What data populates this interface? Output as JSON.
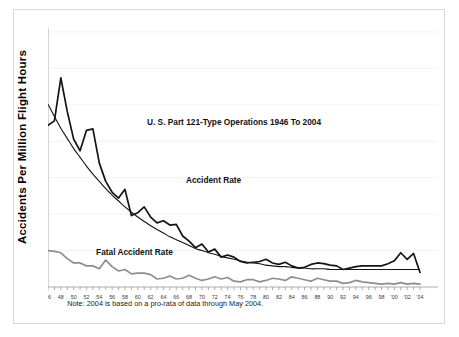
{
  "figure": {
    "note": "Note: 2004 is based on a pro-rata of data through May 2004.",
    "ylabel": "Accidents Per Million Flight Hours",
    "title": "U. S. Part 121-Type Operations 1946 To 2004",
    "label_accident": "Accident Rate",
    "label_fatal": "Fatal Accident Rate"
  },
  "colors": {
    "accident": "#141414",
    "trend": "#141414",
    "fatal": "#8e8e8e",
    "grid": "#ececec",
    "axis": "#9a9a9a",
    "border": "#d8d8d8"
  },
  "chart_data": {
    "type": "line",
    "title": "U. S. Part 121-Type Operations 1946 To 2004",
    "xlabel": "",
    "ylabel": "Accidents Per Million Flight Hours",
    "ylim": [
      0,
      35
    ],
    "xlim": [
      1946,
      2004
    ],
    "yticks": [
      0,
      5,
      10,
      15,
      20,
      25,
      30,
      35
    ],
    "ytick_labels": [
      "0",
      "5",
      "10",
      "15",
      "20",
      "25",
      "30",
      "35"
    ],
    "grid": true,
    "grid_axis": "y",
    "legend": "inline-annotations",
    "annotations": [
      {
        "text": "U. S. Part 121-Type Operations 1946 To 2004",
        "x": 1975,
        "y": 22.2
      },
      {
        "text": "Accident Rate",
        "x": 1967.5,
        "y": 14.3
      },
      {
        "text": "Fatal Accident Rate",
        "x": 1953.5,
        "y": 4.4
      },
      {
        "text": "Note: 2004 is based on a pro-rata of data through May 2004.",
        "x": 1949,
        "y": -2.6
      }
    ],
    "x": [
      1946,
      1947,
      1948,
      1949,
      1950,
      1951,
      1952,
      1953,
      1954,
      1955,
      1956,
      1957,
      1958,
      1959,
      1960,
      1961,
      1962,
      1963,
      1964,
      1965,
      1966,
      1967,
      1968,
      1969,
      1970,
      1971,
      1972,
      1973,
      1974,
      1975,
      1976,
      1977,
      1978,
      1979,
      1980,
      1981,
      1982,
      1983,
      1984,
      1985,
      1986,
      1987,
      1988,
      1989,
      1990,
      1991,
      1992,
      1993,
      1994,
      1995,
      1996,
      1997,
      1998,
      1999,
      2000,
      2001,
      2002,
      2003,
      2004
    ],
    "xtick_labels": [
      "46",
      "48",
      "50",
      "52",
      "54",
      "56",
      "58",
      "60",
      "62",
      "64",
      "66",
      "68",
      "70",
      "72",
      "74",
      "76",
      "78",
      "80",
      "82",
      "84",
      "86",
      "88",
      "90",
      "92",
      "94",
      "96",
      "98",
      "'00",
      "'02",
      "'04"
    ],
    "series": [
      {
        "name": "Accident Rate",
        "color": "#141414",
        "style": "solid",
        "width": 1.7,
        "values": [
          22.2,
          22.8,
          28.7,
          24.1,
          20.3,
          18.7,
          21.5,
          21.7,
          17.0,
          14.5,
          13.0,
          12.2,
          13.4,
          9.8,
          10.2,
          11.0,
          9.6,
          8.8,
          9.1,
          8.5,
          8.6,
          7.0,
          6.3,
          5.4,
          5.9,
          4.8,
          5.2,
          4.1,
          4.4,
          4.1,
          3.5,
          3.3,
          3.4,
          3.5,
          3.8,
          3.3,
          3.1,
          3.4,
          2.9,
          2.6,
          2.7,
          3.1,
          3.3,
          3.2,
          3.0,
          2.9,
          2.4,
          2.6,
          2.8,
          2.9,
          2.9,
          2.9,
          2.9,
          3.2,
          3.6,
          4.7,
          3.8,
          4.6,
          2.0
        ]
      },
      {
        "name": "Accident Rate Trend",
        "color": "#141414",
        "style": "smooth-trend",
        "width": 1.1,
        "values": [
          25.1,
          23.4,
          21.8,
          20.4,
          19.0,
          17.8,
          16.6,
          15.5,
          14.5,
          13.5,
          12.6,
          11.8,
          11.0,
          10.3,
          9.6,
          9.0,
          8.4,
          7.9,
          7.4,
          6.9,
          6.5,
          6.1,
          5.7,
          5.3,
          5.0,
          4.7,
          4.5,
          4.2,
          4.0,
          3.8,
          3.6,
          3.4,
          3.3,
          3.2,
          3.0,
          2.9,
          2.8,
          2.8,
          2.7,
          2.6,
          2.6,
          2.5,
          2.5,
          2.5,
          2.4,
          2.4,
          2.4,
          2.4,
          2.4,
          2.4,
          2.4,
          2.4,
          2.4,
          2.4,
          2.4,
          2.4,
          2.4,
          2.4,
          2.4
        ]
      },
      {
        "name": "Fatal Accident Rate",
        "color": "#8e8e8e",
        "style": "solid",
        "width": 1.7,
        "values": [
          5.0,
          4.9,
          4.7,
          3.9,
          3.3,
          3.3,
          2.9,
          2.9,
          2.5,
          3.7,
          2.8,
          2.2,
          2.4,
          1.8,
          1.9,
          1.9,
          1.7,
          1.1,
          1.2,
          1.5,
          1.1,
          1.2,
          1.6,
          1.2,
          0.9,
          1.1,
          1.4,
          1.1,
          1.3,
          0.8,
          0.7,
          1.0,
          1.0,
          0.7,
          0.9,
          1.2,
          1.1,
          0.9,
          1.4,
          1.2,
          1.0,
          0.8,
          1.2,
          1.0,
          0.8,
          0.8,
          0.5,
          0.6,
          0.9,
          0.7,
          0.6,
          0.5,
          0.4,
          0.5,
          0.4,
          0.6,
          0.4,
          0.5,
          0.4
        ]
      }
    ]
  }
}
